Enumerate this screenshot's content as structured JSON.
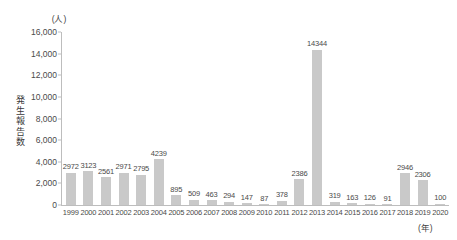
{
  "chart_data": {
    "type": "bar",
    "title": "",
    "xlabel": "(年)",
    "ylabel": "発生報告数",
    "yunit": "(人)",
    "ylim": [
      0,
      16000
    ],
    "yticks": [
      0,
      2000,
      4000,
      6000,
      8000,
      10000,
      12000,
      14000,
      16000
    ],
    "ytick_labels": [
      "0",
      "2,000",
      "4,000",
      "6,000",
      "8,000",
      "10,000",
      "12,000",
      "14,000",
      "16,000"
    ],
    "grid": false,
    "legend": null,
    "bar_color": "#c9c9c9",
    "axis_color": "#bdbdbd",
    "categories": [
      "1999",
      "2000",
      "2001",
      "2002",
      "2003",
      "2004",
      "2005",
      "2006",
      "2007",
      "2008",
      "2009",
      "2010",
      "2011",
      "2012",
      "2013",
      "2014",
      "2015",
      "2016",
      "2017",
      "2018",
      "2019",
      "2020"
    ],
    "values": [
      2972,
      3123,
      2561,
      2971,
      2795,
      4239,
      895,
      509,
      463,
      294,
      147,
      87,
      378,
      2386,
      14344,
      319,
      163,
      126,
      91,
      2946,
      2306,
      100
    ],
    "value_labels": [
      "2972",
      "3123",
      "2561",
      "2971",
      "2795",
      "4239",
      "895",
      "509",
      "463",
      "294",
      "147",
      "87",
      "378",
      "2386",
      "14344",
      "319",
      "163",
      "126",
      "91",
      "2946",
      "2306",
      "100"
    ]
  }
}
